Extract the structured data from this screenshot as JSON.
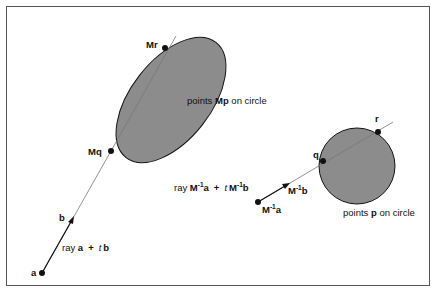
{
  "diagram": {
    "type": "ray-ellipse intersection via inverse transform",
    "colors": {
      "shape_fill": "#8c8c8c",
      "stroke": "#111111",
      "line": "#777777",
      "background": "#ffffff"
    },
    "left": {
      "ray_label": {
        "prefix": "ray ",
        "a": "a",
        "plus": "+",
        "t": "t",
        "b": "b"
      },
      "origin_label": "a",
      "direction_label": "b",
      "entry_label": "Mq",
      "exit_label": "Mr",
      "shape_label": {
        "prefix": "points ",
        "bold": "Mp",
        "suffix": "  on circle"
      }
    },
    "right": {
      "ray_label": {
        "prefix": "ray ",
        "m1": "M",
        "exp": "-1",
        "a": "a",
        "plus": "+",
        "t": "t",
        "m2": "M",
        "b": "b"
      },
      "origin_label": {
        "m": "M",
        "exp": "-1",
        "v": "a"
      },
      "direction_label": {
        "m": "M",
        "exp": "-1",
        "v": "b"
      },
      "entry_label": "q",
      "exit_label": "r",
      "shape_label": {
        "prefix": "points ",
        "bold": "p",
        "suffix": "  on circle"
      }
    }
  }
}
